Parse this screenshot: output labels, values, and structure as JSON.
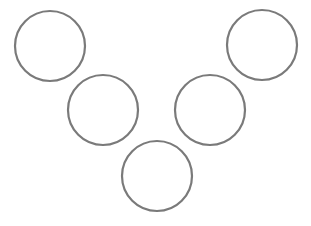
{
  "diagram": {
    "background": "#ffffff",
    "stroke_color": "#7a7a7a",
    "stroke_width": 2.2,
    "radius": 35,
    "circles": [
      {
        "id": "top-left",
        "cx": 50,
        "cy": 46
      },
      {
        "id": "middle-left",
        "cx": 103,
        "cy": 110
      },
      {
        "id": "bottom-center",
        "cx": 157,
        "cy": 176
      },
      {
        "id": "middle-right",
        "cx": 210,
        "cy": 110
      },
      {
        "id": "top-right",
        "cx": 262,
        "cy": 45
      }
    ]
  }
}
